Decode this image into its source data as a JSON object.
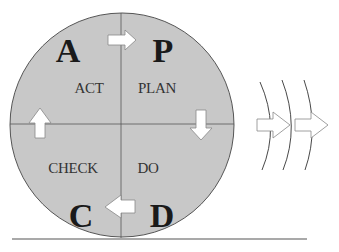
{
  "diagram": {
    "colors": {
      "circle_fill": "#c8c8c8",
      "circle_stroke": "#555555",
      "arrow_fill": "#ffffff",
      "arrow_stroke": "#888888",
      "ground_line": "#555555"
    },
    "quadrants": [
      {
        "position": "top-left",
        "letter": "A",
        "label": "ACT"
      },
      {
        "position": "top-right",
        "letter": "P",
        "label": "PLAN"
      },
      {
        "position": "bottom-right",
        "letter": "D",
        "label": "DO"
      },
      {
        "position": "bottom-left",
        "letter": "C",
        "label": "CHECK"
      }
    ],
    "cycle_arrows": [
      {
        "from": "A",
        "to": "P",
        "direction": "right"
      },
      {
        "from": "P",
        "to": "D",
        "direction": "down"
      },
      {
        "from": "D",
        "to": "C",
        "direction": "left"
      },
      {
        "from": "C",
        "to": "A",
        "direction": "up"
      }
    ],
    "motion_indicator": {
      "arcs": 3,
      "arrows": 2,
      "direction": "right"
    }
  }
}
